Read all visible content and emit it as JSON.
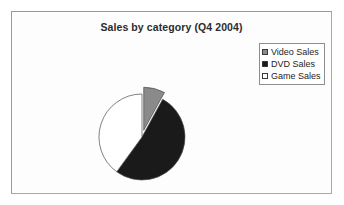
{
  "chart": {
    "title": "Sales by category (Q4 2004)"
  },
  "legend": {
    "items": [
      {
        "label": "Video Sales",
        "swatch": "gray-swatch-icon",
        "color": "#8a8a8a"
      },
      {
        "label": "DVD Sales",
        "swatch": "black-swatch-icon",
        "color": "#1a1a1a"
      },
      {
        "label": "Game Sales",
        "swatch": "white-swatch-icon",
        "color": "#ffffff"
      }
    ]
  },
  "chart_data": {
    "type": "pie",
    "title": "Sales by category (Q4 2004)",
    "xlabel": "",
    "ylabel": "",
    "categories": [
      "Video Sales",
      "DVD Sales",
      "Game Sales"
    ],
    "values": [
      8,
      52,
      40
    ],
    "unit": "percent",
    "colors": [
      "#8a8a8a",
      "#1a1a1a",
      "#ffffff"
    ],
    "exploded": [
      "Video Sales"
    ],
    "start_angle": 0,
    "direction": "clockwise",
    "legend_position": "top-right",
    "grid": false,
    "data_labels": false
  }
}
